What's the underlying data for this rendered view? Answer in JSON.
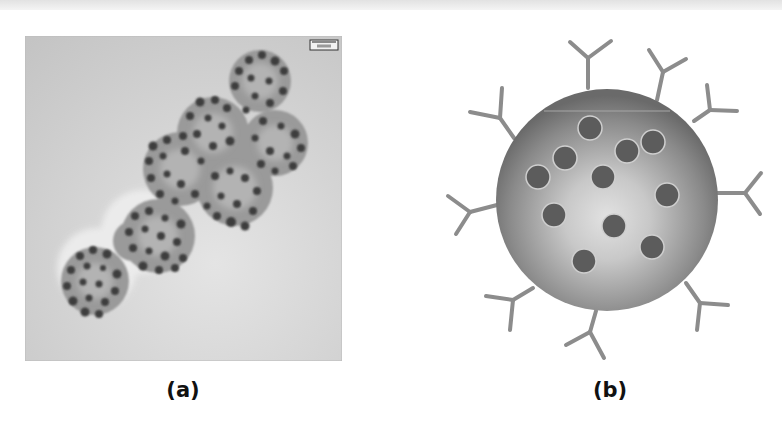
{
  "figure": {
    "panels": [
      {
        "id": "a",
        "label": "(a)",
        "type": "TEM micrograph",
        "description": "Grayscale transmission electron micrograph of aggregated spherical clusters densely studded with dark nanoparticles",
        "scale_bar": {
          "text": "500 nm"
        }
      },
      {
        "id": "b",
        "label": "(b)",
        "type": "schematic",
        "description": "Schematic of a gray sphere containing 11 embedded dark nanoparticles with Y-shaped antibodies attached around the surface",
        "embedded_particle_count": 11,
        "antibody_count": 10
      }
    ]
  },
  "colors": {
    "background": "#ffffff",
    "tem_background": "#cfcfcf",
    "sphere_edge": "#6a6a6a",
    "sphere_center": "#dcdcdc",
    "particle": "#5c5c5c",
    "antibody": "#8c8c8c",
    "label_text": "#111111"
  }
}
